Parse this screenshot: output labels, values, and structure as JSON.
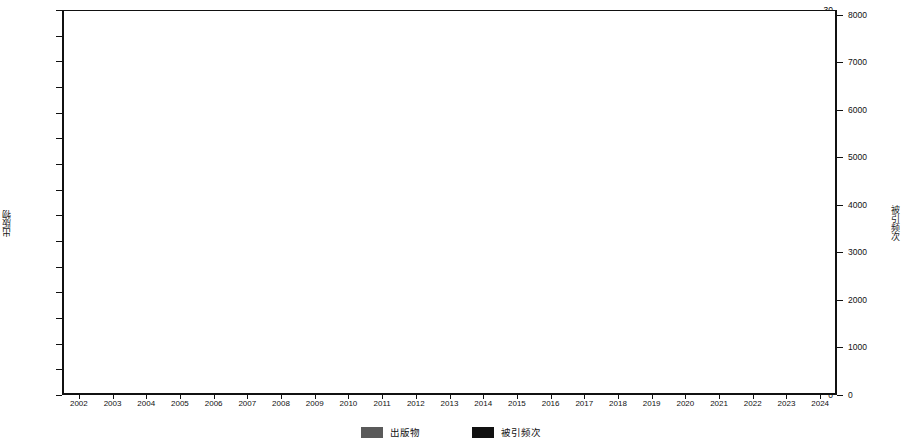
{
  "chart_data": {
    "type": "bar",
    "title": "",
    "subtitle": "",
    "xlabel": "",
    "ylabel": "出版物",
    "y2label": "被引频次",
    "grid": true,
    "legend_position": "bottom",
    "categories": [
      "2002",
      "2003",
      "2004",
      "2005",
      "2006",
      "2007",
      "2008",
      "2009",
      "2010",
      "2011",
      "2012",
      "2013",
      "2014",
      "2015",
      "2016",
      "2017",
      "2018",
      "2019",
      "2020",
      "2021",
      "2022",
      "2023",
      "2024"
    ],
    "ylim": [
      0,
      30
    ],
    "yticks": [
      0,
      2,
      4,
      6,
      8,
      10,
      12,
      14,
      16,
      18,
      20,
      22,
      24,
      26,
      28,
      30
    ],
    "y2lim": [
      0,
      8100
    ],
    "y2ticks": [
      0,
      1000,
      2000,
      3000,
      4000,
      5000,
      6000,
      7000,
      8000
    ],
    "series": [
      {
        "name": "出版物",
        "type": "bar",
        "axis": "left",
        "color": "#5a5a5a",
        "values": [
          4,
          1,
          8,
          10,
          8,
          11,
          6,
          8,
          8,
          13,
          13,
          21,
          21,
          24,
          28,
          30,
          21,
          21,
          19,
          26,
          22,
          15,
          5
        ]
      },
      {
        "name": "被引频次",
        "type": "line",
        "axis": "right",
        "color": "#000000",
        "values": [
          20,
          40,
          80,
          130,
          200,
          290,
          380,
          420,
          560,
          720,
          950,
          1500,
          2200,
          2900,
          3800,
          5000,
          5600,
          6200,
          6800,
          7550,
          8150,
          7400,
          3050
        ]
      }
    ]
  },
  "legend": {
    "items": [
      {
        "label": "出版物",
        "color": "#5a5a5a",
        "icon": "bar-swatch"
      },
      {
        "label": "被引频次",
        "color": "#111111",
        "icon": "line-swatch"
      }
    ]
  },
  "axes": {
    "left_title": "出版物",
    "right_title": "被引频次"
  }
}
